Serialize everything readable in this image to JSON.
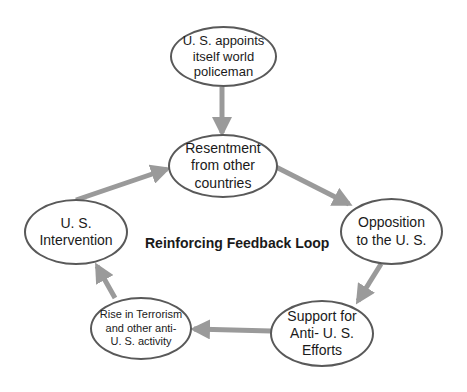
{
  "diagram": {
    "title": "Reinforcing Feedback Loop",
    "colors": {
      "arrow": "#9a9a9a",
      "node_border": "#595959",
      "text": "#1a1a1a",
      "background": "#ffffff"
    },
    "nodes": [
      {
        "id": "us-appoints",
        "label": "U. S. appoints\nitself world\npoliceman"
      },
      {
        "id": "resentment",
        "label": "Resentment\nfrom other\ncountries"
      },
      {
        "id": "opposition",
        "label": "Opposition\nto the U. S."
      },
      {
        "id": "support",
        "label": "Support for\nAnti- U. S.\nEfforts"
      },
      {
        "id": "rise",
        "label": "Rise in Terrorism\nand other anti-\nU. S. activity"
      },
      {
        "id": "intervention",
        "label": "U. S.\nIntervention"
      }
    ],
    "edges": [
      {
        "from": "us-appoints",
        "to": "resentment"
      },
      {
        "from": "resentment",
        "to": "opposition"
      },
      {
        "from": "opposition",
        "to": "support"
      },
      {
        "from": "support",
        "to": "rise"
      },
      {
        "from": "rise",
        "to": "intervention"
      },
      {
        "from": "intervention",
        "to": "resentment"
      }
    ]
  }
}
